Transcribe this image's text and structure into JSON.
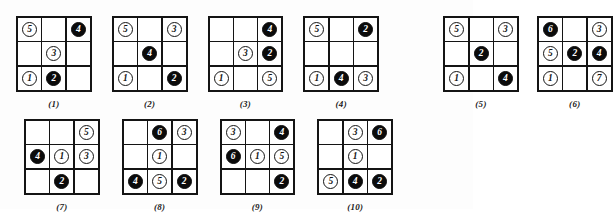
{
  "document": {
    "title": "Ten 3x3 grid puzzle figures with circled numbers",
    "token_styles": {
      "white": "outlined-circle",
      "black": "filled-circle"
    },
    "colors": {
      "ink": "#141414",
      "paper": "#ffffff",
      "filled_token": "#0b0b0b"
    }
  },
  "figures": [
    {
      "caption": "(1)",
      "cells": [
        {
          "value": "5",
          "style": "white"
        },
        {
          "value": "",
          "style": "empty"
        },
        {
          "value": "4",
          "style": "black"
        },
        {
          "value": "",
          "style": "empty"
        },
        {
          "value": "3",
          "style": "white"
        },
        {
          "value": "",
          "style": "empty"
        },
        {
          "value": "1",
          "style": "white"
        },
        {
          "value": "2",
          "style": "black"
        },
        {
          "value": "",
          "style": "empty"
        }
      ]
    },
    {
      "caption": "(2)",
      "cells": [
        {
          "value": "5",
          "style": "white"
        },
        {
          "value": "",
          "style": "empty"
        },
        {
          "value": "3",
          "style": "white"
        },
        {
          "value": "",
          "style": "empty"
        },
        {
          "value": "4",
          "style": "black"
        },
        {
          "value": "",
          "style": "empty"
        },
        {
          "value": "1",
          "style": "white"
        },
        {
          "value": "",
          "style": "empty"
        },
        {
          "value": "2",
          "style": "black"
        }
      ]
    },
    {
      "caption": "(3)",
      "cells": [
        {
          "value": "",
          "style": "empty"
        },
        {
          "value": "",
          "style": "empty"
        },
        {
          "value": "4",
          "style": "black"
        },
        {
          "value": "",
          "style": "empty"
        },
        {
          "value": "3",
          "style": "white"
        },
        {
          "value": "2",
          "style": "black"
        },
        {
          "value": "1",
          "style": "white"
        },
        {
          "value": "",
          "style": "empty"
        },
        {
          "value": "5",
          "style": "white"
        }
      ]
    },
    {
      "caption": "(4)",
      "cells": [
        {
          "value": "5",
          "style": "white"
        },
        {
          "value": "",
          "style": "empty"
        },
        {
          "value": "2",
          "style": "black"
        },
        {
          "value": "",
          "style": "empty"
        },
        {
          "value": "",
          "style": "empty"
        },
        {
          "value": "",
          "style": "empty"
        },
        {
          "value": "1",
          "style": "white"
        },
        {
          "value": "4",
          "style": "black"
        },
        {
          "value": "3",
          "style": "white"
        }
      ]
    },
    {
      "caption": "(5)",
      "cells": [
        {
          "value": "5",
          "style": "white"
        },
        {
          "value": "",
          "style": "empty"
        },
        {
          "value": "3",
          "style": "white"
        },
        {
          "value": "",
          "style": "empty"
        },
        {
          "value": "2",
          "style": "black"
        },
        {
          "value": "",
          "style": "empty"
        },
        {
          "value": "1",
          "style": "white"
        },
        {
          "value": "",
          "style": "empty"
        },
        {
          "value": "4",
          "style": "black"
        }
      ]
    },
    {
      "caption": "(6)",
      "cells": [
        {
          "value": "6",
          "style": "black"
        },
        {
          "value": "",
          "style": "empty"
        },
        {
          "value": "3",
          "style": "white"
        },
        {
          "value": "5",
          "style": "white"
        },
        {
          "value": "2",
          "style": "black"
        },
        {
          "value": "4",
          "style": "black"
        },
        {
          "value": "1",
          "style": "white"
        },
        {
          "value": "",
          "style": "empty"
        },
        {
          "value": "7",
          "style": "white"
        }
      ]
    },
    {
      "caption": "(7)",
      "cells": [
        {
          "value": "",
          "style": "empty"
        },
        {
          "value": "",
          "style": "empty"
        },
        {
          "value": "5",
          "style": "white"
        },
        {
          "value": "4",
          "style": "black"
        },
        {
          "value": "1",
          "style": "white"
        },
        {
          "value": "3",
          "style": "white"
        },
        {
          "value": "",
          "style": "empty"
        },
        {
          "value": "2",
          "style": "black"
        },
        {
          "value": "",
          "style": "empty"
        }
      ]
    },
    {
      "caption": "(8)",
      "cells": [
        {
          "value": "",
          "style": "empty"
        },
        {
          "value": "6",
          "style": "black"
        },
        {
          "value": "3",
          "style": "white"
        },
        {
          "value": "",
          "style": "empty"
        },
        {
          "value": "1",
          "style": "white"
        },
        {
          "value": "",
          "style": "empty"
        },
        {
          "value": "4",
          "style": "black"
        },
        {
          "value": "5",
          "style": "white"
        },
        {
          "value": "2",
          "style": "black"
        }
      ]
    },
    {
      "caption": "(9)",
      "cells": [
        {
          "value": "3",
          "style": "white"
        },
        {
          "value": "",
          "style": "empty"
        },
        {
          "value": "4",
          "style": "black"
        },
        {
          "value": "6",
          "style": "black"
        },
        {
          "value": "1",
          "style": "white"
        },
        {
          "value": "5",
          "style": "white"
        },
        {
          "value": "",
          "style": "empty"
        },
        {
          "value": "",
          "style": "empty"
        },
        {
          "value": "2",
          "style": "black"
        }
      ]
    },
    {
      "caption": "(10)",
      "cells": [
        {
          "value": "",
          "style": "empty"
        },
        {
          "value": "3",
          "style": "white"
        },
        {
          "value": "6",
          "style": "black"
        },
        {
          "value": "",
          "style": "empty"
        },
        {
          "value": "1",
          "style": "white"
        },
        {
          "value": "",
          "style": "empty"
        },
        {
          "value": "5",
          "style": "white"
        },
        {
          "value": "4",
          "style": "black"
        },
        {
          "value": "2",
          "style": "black"
        }
      ]
    }
  ]
}
